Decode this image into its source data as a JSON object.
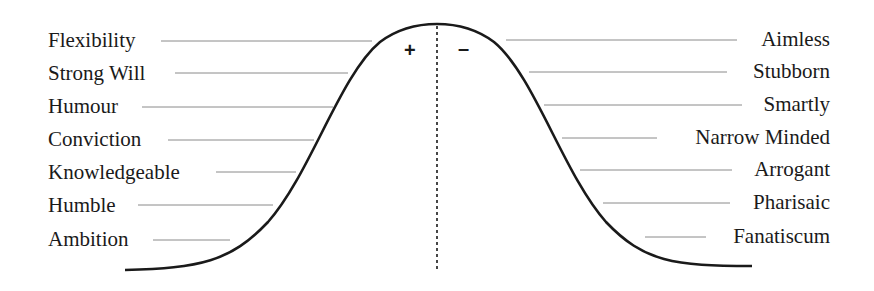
{
  "diagram": {
    "type": "bell-curve",
    "center_signs": {
      "positive": "+",
      "negative": "–"
    },
    "left_labels": [
      {
        "label": "Flexibility"
      },
      {
        "label": "Strong Will"
      },
      {
        "label": "Humour"
      },
      {
        "label": "Conviction"
      },
      {
        "label": "Knowledgeable"
      },
      {
        "label": "Humble"
      },
      {
        "label": "Ambition"
      }
    ],
    "right_labels": [
      {
        "label": "Aimless"
      },
      {
        "label": "Stubborn"
      },
      {
        "label": "Smartly"
      },
      {
        "label": "Narrow Minded"
      },
      {
        "label": "Arrogant"
      },
      {
        "label": "Pharisaic"
      },
      {
        "label": "Fanatiscum"
      }
    ],
    "colors": {
      "curve": "#1a1a1a",
      "leader": "#8a8a8a",
      "text": "#1a1a1a"
    }
  }
}
